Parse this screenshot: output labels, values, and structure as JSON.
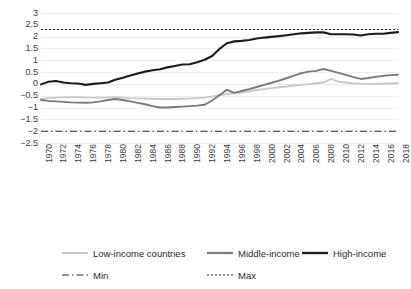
{
  "chart_data": {
    "type": "line",
    "title": "",
    "xlabel": "",
    "ylabel": "",
    "ylim": [
      -2.5,
      3
    ],
    "ytick_step": 0.5,
    "grid": true,
    "legend_position": "bottom",
    "yticks": [
      "3",
      "2.5",
      "2",
      "1.5",
      "1",
      "0.5",
      "0",
      "-0.5",
      "-1",
      "-1.5",
      "-2",
      "-2.5"
    ],
    "x": [
      1970,
      1971,
      1972,
      1973,
      1974,
      1975,
      1976,
      1977,
      1978,
      1979,
      1980,
      1981,
      1982,
      1983,
      1984,
      1985,
      1986,
      1987,
      1988,
      1989,
      1990,
      1991,
      1992,
      1993,
      1994,
      1995,
      1996,
      1997,
      1998,
      1999,
      2000,
      2001,
      2002,
      2003,
      2004,
      2005,
      2006,
      2007,
      2008,
      2009,
      2010,
      2011,
      2012,
      2013,
      2014,
      2015,
      2016,
      2017,
      2018
    ],
    "xticks": [
      "1970",
      "1972",
      "1974",
      "1976",
      "1978",
      "1980",
      "1982",
      "1984",
      "1986",
      "1988",
      "1990",
      "1992",
      "1994",
      "1996",
      "1998",
      "2000",
      "2002",
      "2004",
      "2006",
      "2008",
      "2010",
      "2012",
      "2014",
      "2016",
      "2018"
    ],
    "series": [
      {
        "name": "Low-income countries",
        "color": "#c9c9c9",
        "style": "solid",
        "values": [
          -0.63,
          -0.6,
          -0.58,
          -0.57,
          -0.56,
          -0.56,
          -0.57,
          -0.58,
          -0.58,
          -0.57,
          -0.56,
          -0.58,
          -0.6,
          -0.61,
          -0.62,
          -0.63,
          -0.64,
          -0.64,
          -0.64,
          -0.63,
          -0.62,
          -0.6,
          -0.58,
          -0.53,
          -0.47,
          -0.43,
          -0.4,
          -0.36,
          -0.31,
          -0.26,
          -0.22,
          -0.18,
          -0.14,
          -0.11,
          -0.07,
          -0.04,
          -0.01,
          0.03,
          0.06,
          0.21,
          0.09,
          0.06,
          0.03,
          0.01,
          0.0,
          0.0,
          0.01,
          0.02,
          0.03
        ]
      },
      {
        "name": "Middle-income",
        "color": "#7a7a7a",
        "style": "solid",
        "values": [
          -0.68,
          -0.72,
          -0.74,
          -0.76,
          -0.78,
          -0.79,
          -0.8,
          -0.78,
          -0.74,
          -0.68,
          -0.64,
          -0.68,
          -0.74,
          -0.8,
          -0.86,
          -0.94,
          -1.0,
          -1.0,
          -0.98,
          -0.96,
          -0.94,
          -0.92,
          -0.88,
          -0.7,
          -0.48,
          -0.25,
          -0.38,
          -0.3,
          -0.22,
          -0.13,
          -0.04,
          0.05,
          0.14,
          0.24,
          0.35,
          0.45,
          0.52,
          0.55,
          0.63,
          0.55,
          0.47,
          0.38,
          0.29,
          0.21,
          0.25,
          0.3,
          0.34,
          0.37,
          0.39
        ]
      },
      {
        "name": "High-income",
        "color": "#1c1c1c",
        "style": "solid",
        "values": [
          -0.02,
          0.09,
          0.12,
          0.06,
          0.03,
          0.02,
          -0.04,
          0.0,
          0.03,
          0.06,
          0.18,
          0.26,
          0.36,
          0.44,
          0.52,
          0.58,
          0.62,
          0.7,
          0.76,
          0.82,
          0.83,
          0.92,
          1.02,
          1.18,
          1.48,
          1.72,
          1.8,
          1.82,
          1.86,
          1.92,
          1.96,
          1.99,
          2.02,
          2.06,
          2.1,
          2.14,
          2.16,
          2.18,
          2.18,
          2.1,
          2.1,
          2.1,
          2.09,
          2.05,
          2.1,
          2.12,
          2.12,
          2.16,
          2.19
        ]
      }
    ],
    "reference_lines": [
      {
        "name": "Min",
        "value": -2,
        "style": "dash-dot",
        "color": "#2a2a2a"
      },
      {
        "name": "Max",
        "value": 2.3,
        "style": "dotted",
        "color": "#2a2a2a"
      }
    ]
  },
  "legend": {
    "row1": [
      {
        "label": "Low-income countries",
        "swatch": "solid-light-gray-line"
      },
      {
        "label": "Middle-income",
        "swatch": "solid-mid-gray-line"
      },
      {
        "label": "High-income",
        "swatch": "solid-black-line"
      }
    ],
    "row2": [
      {
        "label": "Min",
        "swatch": "dash-dot-line"
      },
      {
        "label": "Max",
        "swatch": "dotted-line"
      }
    ]
  }
}
